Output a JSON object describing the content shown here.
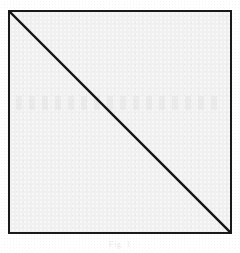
{
  "figure": {
    "caption": "Fig. 1",
    "background_color": "#ffffff",
    "square": {
      "fill_color": "#f0f0f0",
      "border_color": "#1a1a1a",
      "border_width_px": 2,
      "left_px": 8,
      "top_px": 10,
      "size_px": 224
    },
    "diagonal": {
      "stroke_color": "#141414",
      "stroke_width_px": 2,
      "from": "top-left",
      "to": "bottom-right"
    }
  },
  "diagram_data": {
    "type": "geometric-figure",
    "shape": "square",
    "elements": [
      {
        "name": "square-outline",
        "kind": "rectangle",
        "x": 0,
        "y": 0,
        "width": 224,
        "height": 224
      },
      {
        "name": "diagonal",
        "kind": "line",
        "x1": 0,
        "y1": 0,
        "x2": 224,
        "y2": 224
      }
    ],
    "vertices": [
      {
        "label": "top-left",
        "x": 0,
        "y": 0
      },
      {
        "label": "top-right",
        "x": 224,
        "y": 0
      },
      {
        "label": "bottom-right",
        "x": 224,
        "y": 224
      },
      {
        "label": "bottom-left",
        "x": 0,
        "y": 224
      }
    ]
  }
}
